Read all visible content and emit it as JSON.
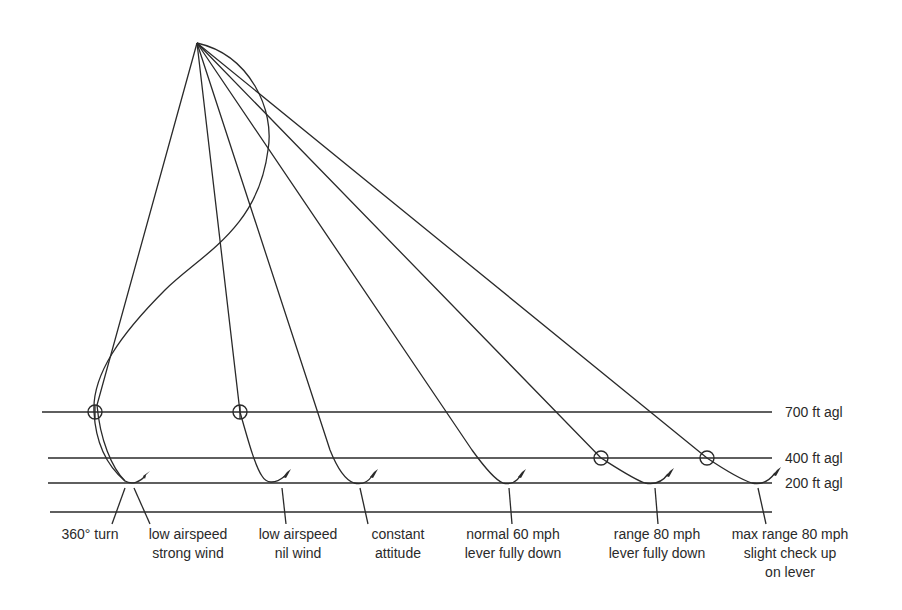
{
  "diagram": {
    "altitude_labels": [
      {
        "text": "700 ft agl",
        "y": 412
      },
      {
        "text": "400 ft agl",
        "y": 458
      },
      {
        "text": "200 ft agl",
        "y": 483
      }
    ],
    "captions": [
      {
        "id": "turn360",
        "lines": [
          "360° turn"
        ],
        "x": 90
      },
      {
        "id": "low-strong",
        "lines": [
          "low airspeed",
          "strong wind"
        ],
        "x": 188
      },
      {
        "id": "low-nil",
        "lines": [
          "low airspeed",
          "nil wind"
        ],
        "x": 298
      },
      {
        "id": "constant",
        "lines": [
          "constant",
          "attitude"
        ],
        "x": 398
      },
      {
        "id": "normal60",
        "lines": [
          "normal 60 mph",
          "lever fully down"
        ],
        "x": 513
      },
      {
        "id": "range80",
        "lines": [
          "range 80 mph",
          "lever fully down"
        ],
        "x": 657
      },
      {
        "id": "maxrange80",
        "lines": [
          "max range 80 mph",
          "slight check up",
          "on lever"
        ],
        "x": 790
      }
    ]
  }
}
